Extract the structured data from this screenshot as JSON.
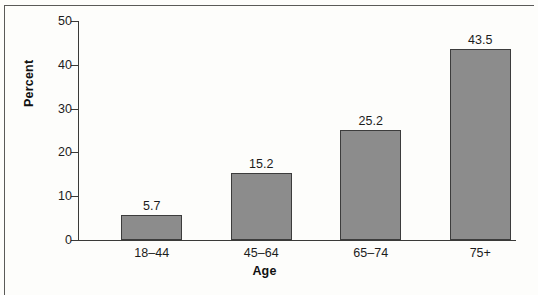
{
  "chart_data": {
    "type": "bar",
    "title": "",
    "subtitle": "",
    "xlabel": "Age",
    "ylabel": "Percent",
    "categories": [
      "18–44",
      "45–64",
      "65–74",
      "75+"
    ],
    "values": [
      5.7,
      15.2,
      25.2,
      43.5
    ],
    "value_labels": [
      "5.7",
      "15.2",
      "25.2",
      "43.5"
    ],
    "ylim": [
      0,
      50
    ],
    "y_ticks": [
      0,
      10,
      20,
      30,
      40,
      50
    ],
    "y_tick_labels": [
      "0",
      "10",
      "20",
      "30",
      "40",
      "50"
    ],
    "grid": false,
    "legend": false,
    "legend_position": "none",
    "bar_color": "#8c8c8c",
    "bar_border_color": "#3c3c3c",
    "axis_color": "#3a3a38",
    "text_color": "#1c1c1c",
    "background_color": "#fdfdfb",
    "frame_border_color": "#5a5a58"
  }
}
